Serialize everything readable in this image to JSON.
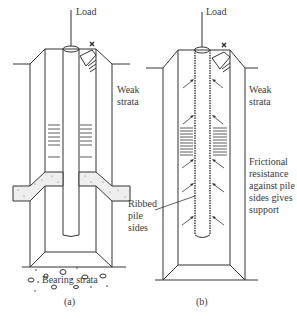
{
  "diagram": {
    "panel_a": {
      "caption": "(a)",
      "load_label": "Load",
      "weak_label_1": "Weak",
      "weak_label_2": "strata",
      "bearing_label": "Bearing strata"
    },
    "panel_b": {
      "caption": "(b)",
      "load_label": "Load",
      "weak_label_1": "Weak",
      "weak_label_2": "strata",
      "ribbed_1": "Ribbed",
      "ribbed_2": "pile",
      "ribbed_3": "sides",
      "friction_1": "Frictional",
      "friction_2": "resistance",
      "friction_3": "against pile",
      "friction_4": "sides gives",
      "friction_5": "support"
    },
    "colors": {
      "line": "#333333",
      "background": "#ffffff"
    }
  }
}
